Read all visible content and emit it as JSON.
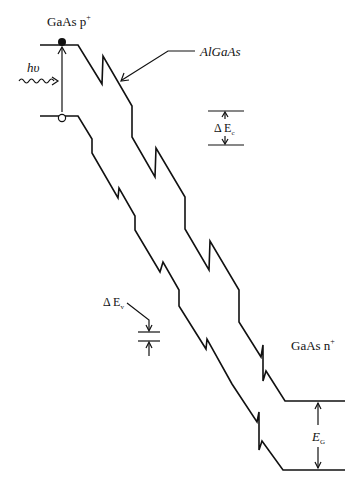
{
  "diagram": {
    "colors": {
      "line": "#111111",
      "background": "#ffffff"
    },
    "labels": {
      "left_material": "GaAs p",
      "left_material_sup": "+",
      "middle_material": "AlGaAs",
      "right_material": "GaAs n",
      "right_material_sup": "+",
      "photon": "hυ",
      "delta_ec_prefix": "Δ E",
      "delta_ec_sub": "c",
      "delta_ev_prefix": "Δ E",
      "delta_ev_sub": "v",
      "bandgap": "E",
      "bandgap_sub": "G"
    },
    "elements": {
      "conduction_band": "staircase conduction band edge with abrupt steps",
      "valence_band": "staircase valence band edge with abrupt steps",
      "electron": "filled circle at conduction band edge",
      "hole": "open circle at valence band edge",
      "photon_arrow": "wavy arrow indicating photon absorption",
      "excitation_arrow": "vertical arrow from hole to electron"
    }
  }
}
